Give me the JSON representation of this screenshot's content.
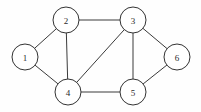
{
  "figure": {
    "background_color": "#fefefe",
    "width": 201,
    "height": 112
  },
  "chart_data": {
    "type": "diagram",
    "subtype": "undirected-graph",
    "title": "",
    "xlabel": "",
    "ylabel": "",
    "grid": false,
    "legend": null,
    "directed": false,
    "weighted": false,
    "node_radius": 13,
    "node_fill": "#ffffff",
    "node_stroke": "#333333",
    "edge_stroke": "#3a3a3a",
    "edge_width": 1,
    "node_count": 6,
    "edge_count": 9,
    "nodes": [
      {
        "id": "1",
        "label": "1",
        "x": 25,
        "y": 57,
        "degree": 2
      },
      {
        "id": "2",
        "label": "2",
        "x": 66,
        "y": 20,
        "degree": 3
      },
      {
        "id": "3",
        "label": "3",
        "x": 133,
        "y": 20,
        "degree": 4
      },
      {
        "id": "4",
        "label": "4",
        "x": 68,
        "y": 92,
        "degree": 4
      },
      {
        "id": "5",
        "label": "5",
        "x": 133,
        "y": 92,
        "degree": 3
      },
      {
        "id": "6",
        "label": "6",
        "x": 177,
        "y": 57,
        "degree": 2
      }
    ],
    "edges": [
      {
        "id": "e1",
        "source": "1",
        "target": "2",
        "label": ""
      },
      {
        "id": "e2",
        "source": "1",
        "target": "4",
        "label": ""
      },
      {
        "id": "e3",
        "source": "2",
        "target": "3",
        "label": ""
      },
      {
        "id": "e4",
        "source": "2",
        "target": "4",
        "label": ""
      },
      {
        "id": "e5",
        "source": "3",
        "target": "4",
        "label": ""
      },
      {
        "id": "e6",
        "source": "3",
        "target": "5",
        "label": ""
      },
      {
        "id": "e7",
        "source": "3",
        "target": "6",
        "label": ""
      },
      {
        "id": "e8",
        "source": "4",
        "target": "5",
        "label": ""
      },
      {
        "id": "e9",
        "source": "5",
        "target": "6",
        "label": ""
      }
    ]
  }
}
